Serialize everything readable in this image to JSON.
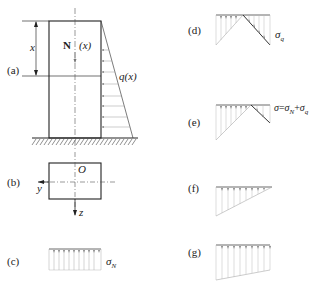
{
  "figure": {
    "panels": [
      {
        "id": "a",
        "label": "(a)",
        "description": "column under distributed load"
      },
      {
        "id": "b",
        "label": "(b)",
        "description": "cross-section"
      },
      {
        "id": "c",
        "label": "(c)",
        "description": "uniform axial stress"
      },
      {
        "id": "d",
        "label": "(d)",
        "description": "bending stress"
      },
      {
        "id": "e",
        "label": "(e)",
        "description": "combined stress"
      },
      {
        "id": "f",
        "label": "(f)",
        "description": "triangular stress distribution"
      },
      {
        "id": "g",
        "label": "(g)",
        "description": "trapezoidal stress distribution"
      }
    ],
    "panel_a": {
      "dimension_label": "x",
      "axial_force_symbol": "N",
      "axial_force_arg": "(x)",
      "load_label": "q(x)"
    },
    "panel_b": {
      "origin_label": "O",
      "y_axis_label": "y",
      "z_axis_label": "z"
    },
    "panel_c": {
      "stress_label": "σ",
      "stress_sub": "N"
    },
    "panel_d": {
      "stress_label": "σ",
      "stress_sub": "q"
    },
    "panel_e": {
      "eq_lhs": "σ",
      "eq_sign": "=",
      "term1": "σ",
      "term1_sub": "N",
      "plus": "+",
      "term2": "σ",
      "term2_sub": "q"
    },
    "colors": {
      "ink": "#222222",
      "hatch_fill": "#9a9a9a"
    }
  }
}
